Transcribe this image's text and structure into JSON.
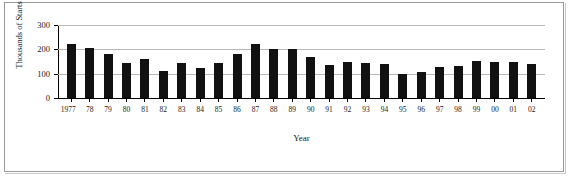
{
  "chart_data": {
    "type": "bar",
    "title": "",
    "xlabel": "Year",
    "ylabel": "Thousands of Starts",
    "ylim": [
      0,
      300
    ],
    "yticks": [
      0,
      100,
      200,
      300
    ],
    "grid": true,
    "legend": null,
    "categories": [
      "1977",
      "78",
      "79",
      "80",
      "81",
      "82",
      "83",
      "84",
      "85",
      "86",
      "87",
      "88",
      "89",
      "90",
      "91",
      "92",
      "93",
      "94",
      "95",
      "96",
      "97",
      "98",
      "99",
      "00",
      "01",
      "02"
    ],
    "values": [
      224,
      205,
      182,
      145,
      162,
      110,
      144,
      122,
      145,
      180,
      223,
      200,
      200,
      170,
      135,
      150,
      143,
      140,
      99,
      105,
      127,
      133,
      152,
      150,
      148,
      138
    ],
    "bar_color": "#111111",
    "grid_color": "#b8b8b8",
    "axis_color": "#000000"
  },
  "axes": {
    "y_title": "Thousands of Starts",
    "x_title": "Year",
    "y_tick_labels": [
      "300",
      "200",
      "100",
      "0"
    ]
  }
}
